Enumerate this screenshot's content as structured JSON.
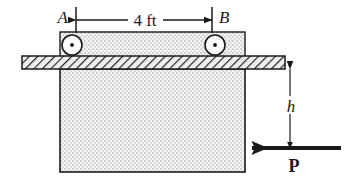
{
  "figure": {
    "background_color": "#ffffff",
    "line_color": "#1a1a1a",
    "fill_stipple_color": "#d8d8d8",
    "fill_base_color": "#f2f2f2",
    "hatch_color": "#2b2b2b"
  },
  "labels": {
    "point_a": "A",
    "point_b": "B",
    "dimension_span": "4 ft",
    "height": "h",
    "force": "P"
  },
  "geometry": {
    "top_block": {
      "x": 60,
      "y": 32,
      "width": 185,
      "height": 25
    },
    "plate": {
      "x": 22,
      "y": 57,
      "width": 263,
      "height": 12
    },
    "main_block": {
      "x": 60,
      "y": 69,
      "width": 185,
      "height": 103
    },
    "roller_a": {
      "cx": 72,
      "cy": 45,
      "r": 10
    },
    "roller_b": {
      "cx": 215,
      "cy": 45,
      "r": 10
    },
    "dimension_line_y": 20,
    "dimension_from_x": 76,
    "dimension_to_x": 212,
    "height_line_x": 290,
    "height_from_y": 69,
    "height_to_y": 148,
    "force_arrow_y": 148,
    "force_arrow_from_x": 340,
    "force_arrow_to_x": 248
  }
}
